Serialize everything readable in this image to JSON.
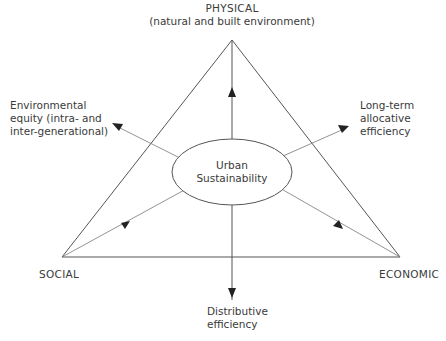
{
  "diagram": {
    "type": "sustainability-triangle",
    "vertices": {
      "top": {
        "title": "PHYSICAL",
        "subtitle": "(natural and built environment)"
      },
      "left": {
        "title": "SOCIAL"
      },
      "right": {
        "title": "ECONOMIC"
      }
    },
    "center": {
      "line1": "Urban",
      "line2": "Sustainability"
    },
    "outcomes": {
      "upper_left": {
        "line1": "Environmental",
        "line2": "equity (intra- and",
        "line3": "inter-generational)"
      },
      "upper_right": {
        "line1": "Long-term",
        "line2": "allocative",
        "line3": "efficiency"
      },
      "bottom": {
        "line1": "Distributive",
        "line2": "efficiency"
      }
    },
    "colors": {
      "line": "#555555",
      "arrow": "#222222",
      "text": "#3a3a3a",
      "background": "#ffffff"
    }
  }
}
